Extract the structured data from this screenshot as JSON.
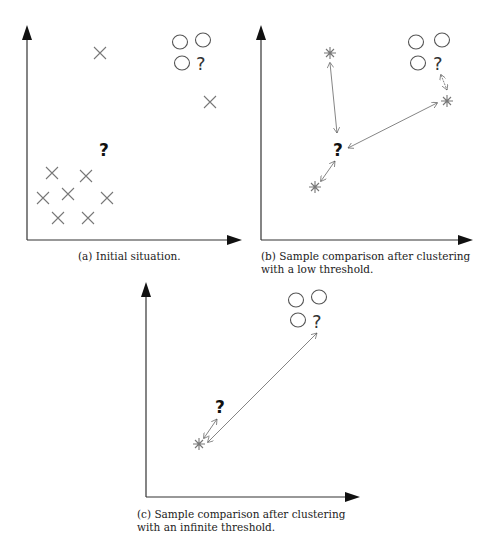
{
  "panels": [
    {
      "id": "a",
      "caption": "(a) Initial situation.",
      "markers": {
        "crosses": [
          [
            100,
            53
          ],
          [
            210,
            102
          ],
          [
            52,
            173
          ],
          [
            86,
            176
          ],
          [
            43,
            198
          ],
          [
            68,
            194
          ],
          [
            107,
            198
          ],
          [
            58,
            218
          ],
          [
            88,
            218
          ]
        ],
        "circles": [
          [
            180,
            42
          ],
          [
            203,
            40
          ],
          [
            182,
            62
          ]
        ],
        "query_light": [
          205,
          63
        ],
        "query_bold": [
          105,
          148
        ]
      }
    },
    {
      "id": "b",
      "caption_line1": "(b) Sample comparison after clustering",
      "caption_line2": "with a low threshold.",
      "markers": {
        "stars": [
          [
            330,
            53
          ],
          [
            447,
            101
          ],
          [
            315,
            187
          ]
        ],
        "circles": [
          [
            416,
            42
          ],
          [
            442,
            40
          ],
          [
            418,
            62
          ]
        ],
        "query_light": [
          441,
          62
        ],
        "query_bold": [
          339,
          148
        ]
      }
    },
    {
      "id": "c",
      "caption_line1": "(c) Sample comparison after clustering",
      "caption_line2": "with an infinite threshold.",
      "markers": {
        "stars": [
          [
            199,
            444
          ]
        ],
        "circles": [
          [
            296,
            300
          ],
          [
            319,
            297
          ],
          [
            298,
            320
          ]
        ],
        "query_light": [
          319,
          320
        ],
        "query_bold": [
          222,
          405
        ]
      }
    }
  ]
}
